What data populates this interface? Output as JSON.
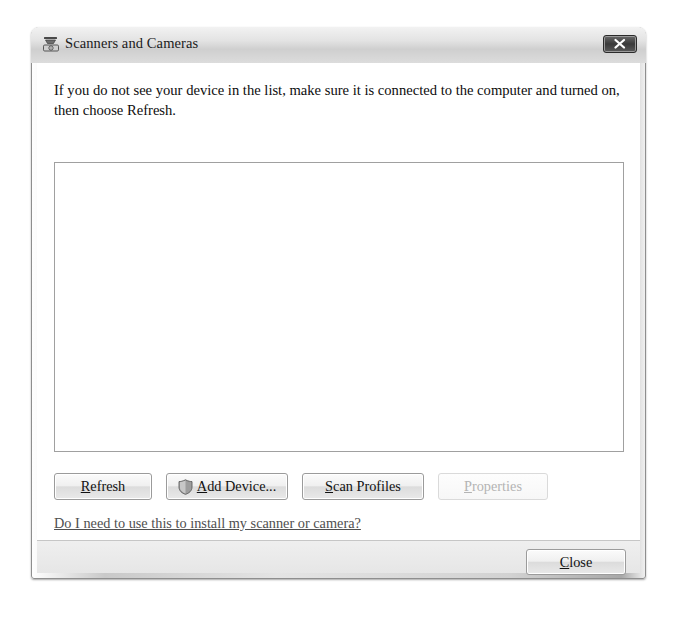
{
  "window": {
    "title": "Scanners and Cameras",
    "title_icon": "scanner-camera-icon",
    "close_icon": "close-x-icon"
  },
  "content": {
    "instructions": "If you do not see your device in the list, make sure it is connected to the computer and turned on, then choose Refresh.",
    "device_list_items": [],
    "help_link": "Do I need to use this to install my scanner or camera?"
  },
  "buttons": {
    "refresh": {
      "accel": "R",
      "rest": "efresh",
      "disabled": false
    },
    "add_device": {
      "accel": "A",
      "rest": "dd Device...",
      "prefix": "",
      "icon": "uac-shield-icon",
      "disabled": false
    },
    "scan_profiles": {
      "accel": "S",
      "rest": "can Profiles",
      "disabled": false
    },
    "properties": {
      "accel": "P",
      "rest": "roperties",
      "disabled": true
    },
    "close": {
      "accel": "C",
      "rest": "lose",
      "disabled": false
    }
  },
  "colors": {
    "titlebar": "#e3e3e3",
    "frame": "#d2d2d2",
    "client_bg": "#ffffff",
    "footer_bg": "#e9e9e9",
    "link": "#4f4f4f",
    "disabled_text": "#b4b4b4",
    "border": "#a0a0a0"
  }
}
